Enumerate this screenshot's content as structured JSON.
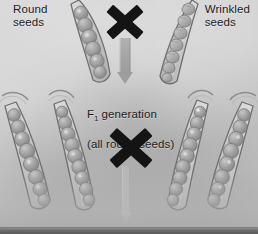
{
  "figure": {
    "background_color": "#c9c9c9",
    "text_color": "#1d1d1d",
    "cross_symbol_color": "#141414",
    "arrow_color": "#9b9b9b",
    "pod_fill_color": "#c4c4c4",
    "pod_outline_color": "#6f6f6f",
    "seed_fill_color": "#9e9e9e"
  },
  "labels": {
    "parent_left": "Round\nseeds",
    "parent_right": "Wrinkled\nseeds",
    "f1_line1_prefix": "F",
    "f1_line1_subscript": "1",
    "f1_line1_suffix": " generation",
    "f1_line2": "(all round seeds)"
  },
  "symbols": {
    "cross_parent": "X",
    "cross_f1": "X",
    "arrow_parent": "down-arrow",
    "arrow_f2": "down-arrow"
  },
  "generations": [
    {
      "name": "parental",
      "pods": [
        {
          "id": "p-round",
          "seed_type": "round",
          "seed_count": 6,
          "rotation": 18
        },
        {
          "id": "p-wrinkled",
          "seed_type": "wrinkled",
          "seed_count": 7,
          "rotation": -20
        }
      ]
    },
    {
      "name": "f1",
      "pods": [
        {
          "id": "f1-a",
          "seed_type": "round",
          "seed_count": 8,
          "rotation": 20
        },
        {
          "id": "f1-b",
          "seed_type": "round",
          "seed_count": 9,
          "rotation": 14
        },
        {
          "id": "f1-c",
          "seed_type": "round",
          "seed_count": 9,
          "rotation": -16
        },
        {
          "id": "f1-d",
          "seed_type": "round",
          "seed_count": 8,
          "rotation": -22
        }
      ]
    }
  ]
}
